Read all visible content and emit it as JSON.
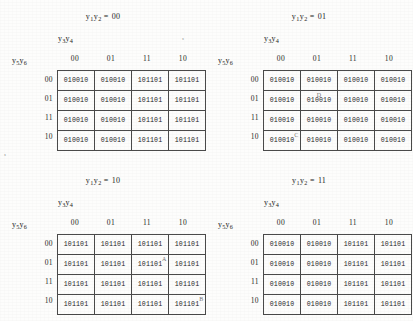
{
  "document": {
    "type": "karnaugh-map-sheet",
    "variables": {
      "title_prefix": "y",
      "col_group_label_parts": [
        "y",
        "3",
        "y",
        "4"
      ],
      "row_group_label_parts": [
        "y",
        "5",
        "y",
        "6"
      ]
    },
    "labels": {
      "col_group": "y3y4",
      "row_group": "y5y6",
      "title_var": "y1y2",
      "equals": "="
    },
    "col_headers": [
      "00",
      "01",
      "11",
      "10"
    ],
    "row_headers": [
      "00",
      "01",
      "11",
      "10"
    ],
    "maps": [
      {
        "id": "map-00",
        "title_value": "00",
        "position": "top-left",
        "rows": [
          [
            "010010",
            "010010",
            "101101",
            "101101"
          ],
          [
            "010010",
            "010010",
            "101101",
            "101101"
          ],
          [
            "010010",
            "010010",
            "101101",
            "101101"
          ],
          [
            "010010",
            "010010",
            "101101",
            "101101"
          ]
        ],
        "annotations": []
      },
      {
        "id": "map-01",
        "title_value": "01",
        "position": "top-right",
        "rows": [
          [
            "010010",
            "010010",
            "010010",
            "010010"
          ],
          [
            "010010",
            "010010",
            "010010",
            "010010"
          ],
          [
            "010010",
            "010010",
            "010010",
            "010010"
          ],
          [
            "010010",
            "010010",
            "010010",
            "010010"
          ]
        ],
        "annotations": [
          {
            "letter": "D",
            "row": 1,
            "col": 1,
            "placement": "pos-tc"
          },
          {
            "letter": "C",
            "row": 3,
            "col": 0,
            "placement": "pos-tr"
          }
        ]
      },
      {
        "id": "map-10",
        "title_value": "10",
        "position": "bottom-left",
        "rows": [
          [
            "101101",
            "101101",
            "101101",
            "101101"
          ],
          [
            "101101",
            "101101",
            "101101",
            "101101"
          ],
          [
            "101101",
            "101101",
            "101101",
            "101101"
          ],
          [
            "101101",
            "101101",
            "101101",
            "101101"
          ]
        ],
        "annotations": [
          {
            "letter": "A",
            "row": 1,
            "col": 2,
            "placement": "pos-tr"
          },
          {
            "letter": "B",
            "row": 3,
            "col": 3,
            "placement": "pos-tr"
          }
        ]
      },
      {
        "id": "map-11",
        "title_value": "11",
        "position": "bottom-right",
        "rows": [
          [
            "010010",
            "010010",
            "101101",
            "101101"
          ],
          [
            "010010",
            "010010",
            "101101",
            "101101"
          ],
          [
            "010010",
            "010010",
            "101101",
            "101101"
          ],
          [
            "010010",
            "010010",
            "101101",
            "101101"
          ]
        ],
        "annotations": []
      }
    ],
    "artifacts": {
      "speck_top": "•",
      "speck_left": "•"
    }
  }
}
